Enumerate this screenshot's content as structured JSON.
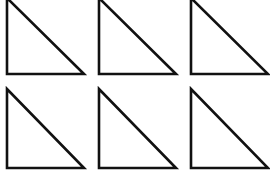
{
  "diagram": {
    "title": "",
    "stroke_color": "#111111",
    "background": "#ffffff",
    "rows": 2,
    "cols": 3,
    "triangles": [
      {
        "row": 0,
        "col": 0,
        "apex": [
          7,
          -2
        ],
        "right_angle": [
          7,
          74
        ],
        "base_end": [
          84,
          74
        ]
      },
      {
        "row": 0,
        "col": 1,
        "apex": [
          99,
          -2
        ],
        "right_angle": [
          99,
          74
        ],
        "base_end": [
          176,
          74
        ]
      },
      {
        "row": 0,
        "col": 2,
        "apex": [
          191,
          -2
        ],
        "right_angle": [
          191,
          74
        ],
        "base_end": [
          268,
          74
        ]
      },
      {
        "row": 1,
        "col": 0,
        "apex": [
          7,
          89
        ],
        "right_angle": [
          7,
          168
        ],
        "base_end": [
          84,
          168
        ]
      },
      {
        "row": 1,
        "col": 1,
        "apex": [
          99,
          89
        ],
        "right_angle": [
          99,
          168
        ],
        "base_end": [
          176,
          168
        ]
      },
      {
        "row": 1,
        "col": 2,
        "apex": [
          191,
          89
        ],
        "right_angle": [
          191,
          168
        ],
        "base_end": [
          268,
          168
        ]
      }
    ]
  }
}
